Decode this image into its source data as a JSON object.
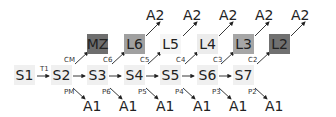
{
  "states": [
    {
      "id": "S1",
      "label": "S1",
      "x": 14,
      "y": 65,
      "fill": "#f0f0f0"
    },
    {
      "id": "S2",
      "label": "S2",
      "x": 51,
      "y": 65,
      "fill": "#f0f0f0"
    },
    {
      "id": "S3",
      "label": "S3",
      "x": 87,
      "y": 65,
      "fill": "#f0f0f0"
    },
    {
      "id": "S4",
      "label": "S4",
      "x": 124,
      "y": 65,
      "fill": "#f0f0f0"
    },
    {
      "id": "S5",
      "label": "S5",
      "x": 160,
      "y": 65,
      "fill": "#f0f0f0"
    },
    {
      "id": "S6",
      "label": "S6",
      "x": 197,
      "y": 65,
      "fill": "#f0f0f0"
    },
    {
      "id": "S7",
      "label": "S7",
      "x": 233,
      "y": 65,
      "fill": "#f0f0f0"
    }
  ],
  "levels": [
    {
      "id": "MZ",
      "label": "MZ",
      "x": 87,
      "y": 34,
      "fill": "#6e6e6e"
    },
    {
      "id": "L6",
      "label": "L6",
      "x": 124,
      "y": 34,
      "fill": "#a0a0a0"
    },
    {
      "id": "L5",
      "label": "L5",
      "x": 160,
      "y": 34,
      "fill": "#f6f6f6"
    },
    {
      "id": "L4",
      "label": "L4",
      "x": 197,
      "y": 34,
      "fill": "#ececec"
    },
    {
      "id": "L3",
      "label": "L3",
      "x": 233,
      "y": 34,
      "fill": "#a6a6a6"
    },
    {
      "id": "L2",
      "label": "L2",
      "x": 269,
      "y": 34,
      "fill": "#707070"
    }
  ],
  "a2_labels": [
    {
      "label": "A2",
      "x": 146,
      "y": 8
    },
    {
      "label": "A2",
      "x": 183,
      "y": 8
    },
    {
      "label": "A2",
      "x": 219,
      "y": 8
    },
    {
      "label": "A2",
      "x": 255,
      "y": 8
    },
    {
      "label": "A2",
      "x": 291,
      "y": 8
    }
  ],
  "a1_labels": [
    {
      "label": "A1",
      "x": 83,
      "y": 99
    },
    {
      "label": "A1",
      "x": 119,
      "y": 99
    },
    {
      "label": "A1",
      "x": 156,
      "y": 99
    },
    {
      "label": "A1",
      "x": 193,
      "y": 99
    },
    {
      "label": "A1",
      "x": 229,
      "y": 99
    },
    {
      "label": "A1",
      "x": 265,
      "y": 99
    }
  ],
  "edge_labels": [
    {
      "label": "T1",
      "x": 40,
      "y": 66
    },
    {
      "label": "CM",
      "x": 64,
      "y": 57
    },
    {
      "label": "C6",
      "x": 103,
      "y": 57
    },
    {
      "label": "C5",
      "x": 140,
      "y": 57
    },
    {
      "label": "C4",
      "x": 176,
      "y": 57
    },
    {
      "label": "C3",
      "x": 213,
      "y": 57
    },
    {
      "label": "C2",
      "x": 248,
      "y": 57
    },
    {
      "label": "PM",
      "x": 64,
      "y": 89
    },
    {
      "label": "P6",
      "x": 102,
      "y": 89
    },
    {
      "label": "P5",
      "x": 138,
      "y": 89
    },
    {
      "label": "P4",
      "x": 175,
      "y": 89
    },
    {
      "label": "P3",
      "x": 212,
      "y": 89
    },
    {
      "label": "P2",
      "x": 248,
      "y": 89
    }
  ],
  "arrows": [
    [
      37,
      76,
      49,
      76
    ],
    [
      73,
      76,
      85,
      76
    ],
    [
      109,
      76,
      121,
      76
    ],
    [
      146,
      76,
      158,
      76
    ],
    [
      182,
      76,
      194,
      76
    ],
    [
      219,
      76,
      231,
      76
    ],
    [
      75,
      64,
      88,
      52
    ],
    [
      112,
      64,
      125,
      52
    ],
    [
      148,
      64,
      161,
      52
    ],
    [
      185,
      64,
      198,
      52
    ],
    [
      221,
      64,
      234,
      52
    ],
    [
      257,
      64,
      270,
      52
    ],
    [
      146,
      36,
      160,
      22
    ],
    [
      183,
      36,
      197,
      22
    ],
    [
      219,
      36,
      233,
      22
    ],
    [
      255,
      36,
      269,
      22
    ],
    [
      291,
      36,
      305,
      22
    ],
    [
      73,
      88,
      85,
      99
    ],
    [
      110,
      88,
      122,
      99
    ],
    [
      146,
      88,
      158,
      99
    ],
    [
      183,
      88,
      195,
      99
    ],
    [
      219,
      88,
      231,
      99
    ],
    [
      255,
      88,
      267,
      99
    ]
  ]
}
